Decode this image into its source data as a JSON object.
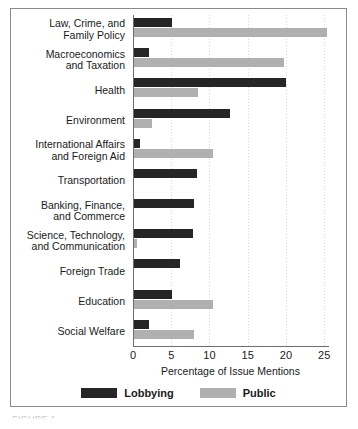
{
  "chart_data": {
    "type": "bar",
    "orientation": "horizontal",
    "title": "",
    "xlabel": "Percentage of Issue Mentions",
    "ylabel": "",
    "xlim": [
      0,
      25.5
    ],
    "xticks": [
      0,
      5,
      10,
      15,
      20,
      25
    ],
    "grid": true,
    "legend_position": "bottom",
    "categories": [
      "Law, Crime, and\nFamily Policy",
      "Macroeconomics\nand Taxation",
      "Health",
      "Environment",
      "International Affairs\nand Foreign Aid",
      "Transportation",
      "Banking, Finance,\nand Commerce",
      "Science, Technology,\nand Communication",
      "Foreign Trade",
      "Education",
      "Social Welfare"
    ],
    "series": [
      {
        "name": "Lobbying",
        "color": "#262626",
        "values": [
          5.0,
          2.0,
          19.9,
          12.6,
          0.8,
          8.2,
          7.9,
          7.7,
          6.0,
          5.0,
          1.9
        ]
      },
      {
        "name": "Public",
        "color": "#b0b0b0",
        "values": [
          25.3,
          19.6,
          8.4,
          2.4,
          10.3,
          0.0,
          0.0,
          0.4,
          0.0,
          10.3,
          7.8
        ]
      }
    ]
  },
  "legend": {
    "items": [
      {
        "label": "Lobbying",
        "color": "#262626"
      },
      {
        "label": "Public",
        "color": "#b0b0b0"
      }
    ]
  },
  "caption": {
    "text": "FIGURE 1."
  }
}
